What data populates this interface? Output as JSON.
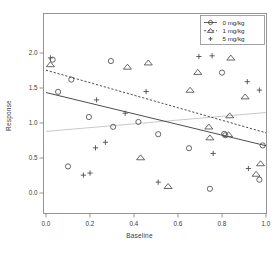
{
  "chart_data": {
    "type": "scatter",
    "title": "",
    "xlabel": "Baseline",
    "ylabel": "Response",
    "xlim": [
      0.0,
      1.0
    ],
    "ylim": [
      0.0,
      2.0
    ],
    "xticks": [
      "0.0",
      "0.2",
      "0.4",
      "0.6",
      "0.8",
      "1.0"
    ],
    "xtick_values": [
      0.0,
      0.2,
      0.4,
      0.6,
      0.8,
      1.0
    ],
    "yticks": [
      "0.0",
      "0.5",
      "1.0",
      "1.5",
      "2.0"
    ],
    "ytick_values": [
      0.0,
      0.5,
      1.0,
      1.5,
      2.0
    ],
    "grid": false,
    "legend_position": "top-right",
    "series": [
      {
        "name": "0 mg/kg",
        "marker": "circle",
        "color": "#4d4d4d",
        "line_style": "solid",
        "fit_line": {
          "x0": 0.0,
          "y0": 1.435,
          "x1": 1.0,
          "y1": 0.675
        },
        "points": [
          {
            "x": 0.03,
            "y": 1.905
          },
          {
            "x": 0.055,
            "y": 1.445
          },
          {
            "x": 0.115,
            "y": 1.62
          },
          {
            "x": 0.195,
            "y": 1.085
          },
          {
            "x": 0.295,
            "y": 1.885
          },
          {
            "x": 0.305,
            "y": 0.945
          },
          {
            "x": 0.42,
            "y": 1.015
          },
          {
            "x": 0.1,
            "y": 0.38
          },
          {
            "x": 0.51,
            "y": 0.84
          },
          {
            "x": 0.65,
            "y": 0.64
          },
          {
            "x": 0.745,
            "y": 0.06
          },
          {
            "x": 0.8,
            "y": 1.72
          },
          {
            "x": 0.81,
            "y": 0.845
          },
          {
            "x": 0.815,
            "y": 0.825
          },
          {
            "x": 0.97,
            "y": 0.19
          },
          {
            "x": 0.985,
            "y": 0.68
          }
        ]
      },
      {
        "name": "1 mg/kg",
        "marker": "triangle",
        "color": "#4d4d4d",
        "line_style": "dashed",
        "fit_line": {
          "x0": 0.0,
          "y0": 1.755,
          "x1": 1.0,
          "y1": 0.86
        },
        "points": [
          {
            "x": 0.02,
            "y": 1.835
          },
          {
            "x": 0.37,
            "y": 1.8
          },
          {
            "x": 0.465,
            "y": 1.86
          },
          {
            "x": 0.43,
            "y": 0.505
          },
          {
            "x": 0.555,
            "y": 0.095
          },
          {
            "x": 0.655,
            "y": 1.47
          },
          {
            "x": 0.69,
            "y": 1.725
          },
          {
            "x": 0.74,
            "y": 0.945
          },
          {
            "x": 0.745,
            "y": 0.79
          },
          {
            "x": 0.84,
            "y": 1.93
          },
          {
            "x": 0.835,
            "y": 1.105
          },
          {
            "x": 0.83,
            "y": 0.835
          },
          {
            "x": 0.905,
            "y": 1.375
          },
          {
            "x": 0.955,
            "y": 0.27
          },
          {
            "x": 0.975,
            "y": 0.42
          }
        ]
      },
      {
        "name": "5 mg/kg",
        "marker": "plus",
        "color": "#4d4d4d",
        "line_style": "none",
        "fit_line": {
          "x0": 0.0,
          "y0": 0.88,
          "x1": 1.0,
          "y1": 1.15
        },
        "points": [
          {
            "x": 0.02,
            "y": 1.93
          },
          {
            "x": 0.17,
            "y": 0.255
          },
          {
            "x": 0.2,
            "y": 0.285
          },
          {
            "x": 0.23,
            "y": 1.33
          },
          {
            "x": 0.225,
            "y": 0.645
          },
          {
            "x": 0.27,
            "y": 0.725
          },
          {
            "x": 0.36,
            "y": 1.14
          },
          {
            "x": 0.455,
            "y": 1.45
          },
          {
            "x": 0.51,
            "y": 0.155
          },
          {
            "x": 0.695,
            "y": 1.95
          },
          {
            "x": 0.755,
            "y": 1.96
          },
          {
            "x": 0.76,
            "y": 0.565
          },
          {
            "x": 0.915,
            "y": 1.59
          },
          {
            "x": 0.92,
            "y": 0.35
          },
          {
            "x": 0.97,
            "y": 1.47
          }
        ]
      }
    ],
    "reference_line": {
      "name": "5 mg/kg fit",
      "color": "#c9c9c9",
      "line_style": "solid"
    }
  },
  "legend": {
    "entries": [
      {
        "label": "0 mg/kg",
        "marker": "circle",
        "line_style": "solid"
      },
      {
        "label": "1 mg/kg",
        "marker": "triangle",
        "line_style": "dashed"
      },
      {
        "label": "5 mg/kg",
        "marker": "plus",
        "line_style": "none"
      }
    ]
  },
  "axes": {
    "x_title": "Baseline",
    "y_title": "Response"
  }
}
